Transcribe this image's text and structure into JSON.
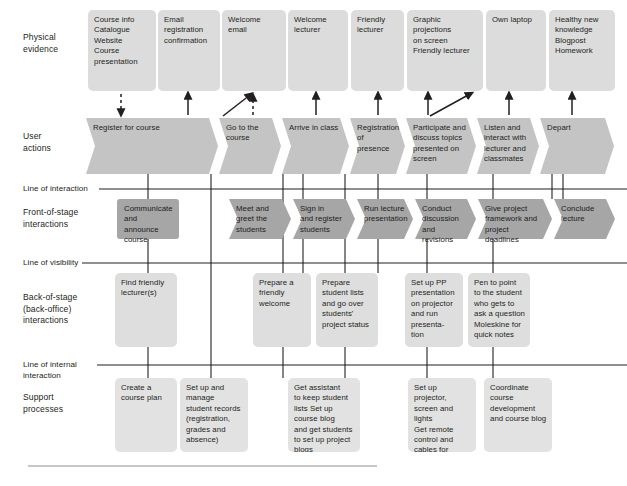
{
  "diagram": {
    "colors": {
      "evidence_fill": "#dcdcdc",
      "user_actions_fill": "#c4c4c4",
      "front_stage_fill": "#a6a6a6",
      "back_stage_fill": "#dedede",
      "support_fill": "#e2e2e2",
      "line_color": "#231f20",
      "text_color": "#231f20"
    }
  },
  "row_labels": {
    "physical_evidence": "Physical\nevidence",
    "user_actions": "User\nactions",
    "front_of_stage": "Front-of-stage\ninteractions",
    "back_of_stage": "Back-of-stage\n(back-office)\ninteractions",
    "support_processes": "Support\nprocesses"
  },
  "separator_lines": {
    "line_of_interaction": "Line of interaction",
    "line_of_visibility": "Line of visibility",
    "line_of_internal_interaction": "Line of internal\ninteraction"
  },
  "physical_evidence": [
    {
      "text": "Course info\nCatalogue\nWebsite\nCourse\npresentation",
      "x": 88,
      "y": 10,
      "w": 68,
      "h": 81
    },
    {
      "text": "Email\nregistration\nconfirmation",
      "x": 158,
      "y": 10,
      "w": 62,
      "h": 81
    },
    {
      "text": "Welcome\nemail",
      "x": 222,
      "y": 10,
      "w": 64,
      "h": 81
    },
    {
      "text": "Welcome\nlecturer",
      "x": 288,
      "y": 10,
      "w": 60,
      "h": 81
    },
    {
      "text": "Friendly\nlecturer",
      "x": 351,
      "y": 10,
      "w": 53,
      "h": 81
    },
    {
      "text": "Graphic\nprojections\non screen\nFriendly lecturer",
      "x": 407,
      "y": 10,
      "w": 76,
      "h": 81
    },
    {
      "text": "Own laptop",
      "x": 486,
      "y": 10,
      "w": 60,
      "h": 81
    },
    {
      "text": "Healthy new\nknowledge\nBlogpost\nHomework",
      "x": 549,
      "y": 10,
      "w": 66,
      "h": 81
    }
  ],
  "user_actions": [
    {
      "text": "Register for course",
      "x": 86,
      "y": 118,
      "w": 132,
      "h": 56
    },
    {
      "text": "Go to the\ncourse",
      "x": 219,
      "y": 118,
      "w": 62,
      "h": 56
    },
    {
      "text": "Arrive in class",
      "x": 282,
      "y": 118,
      "w": 67,
      "h": 56
    },
    {
      "text": "Registration\nof presence",
      "x": 350,
      "y": 118,
      "w": 55,
      "h": 56
    },
    {
      "text": "Participate and\ndiscuss topics\npresented on\nscreen",
      "x": 406,
      "y": 118,
      "w": 70,
      "h": 56
    },
    {
      "text": "Listen and\ninteract with\nlecturer and\nclassmates",
      "x": 477,
      "y": 118,
      "w": 62,
      "h": 56
    },
    {
      "text": "Depart",
      "x": 540,
      "y": 118,
      "w": 74,
      "h": 56
    }
  ],
  "front_of_stage": [
    {
      "text": "Communicate\nand announce\ncourse",
      "x": 117,
      "y": 199,
      "w": 62,
      "h": 40,
      "shape": "rounded"
    },
    {
      "text": "Meet and\ngreet the\nstudents",
      "x": 229,
      "y": 199,
      "w": 62,
      "h": 40,
      "shape": "chevron"
    },
    {
      "text": "Sign in\nand register\nstudents",
      "x": 293,
      "y": 199,
      "w": 62,
      "h": 40,
      "shape": "chevron"
    },
    {
      "text": "Run lecture\npresentation",
      "x": 357,
      "y": 199,
      "w": 56,
      "h": 40,
      "shape": "chevron"
    },
    {
      "text": "Conduct\ndiscussion\nand revisions",
      "x": 415,
      "y": 199,
      "w": 61,
      "h": 40,
      "shape": "chevron"
    },
    {
      "text": "Give project\nframework and\nproject deadlines",
      "x": 478,
      "y": 199,
      "w": 74,
      "h": 40,
      "shape": "chevron"
    },
    {
      "text": "Conclude\nlecture",
      "x": 554,
      "y": 199,
      "w": 61,
      "h": 40,
      "shape": "chevron"
    }
  ],
  "back_of_stage": [
    {
      "text": "Find friendly\nlecturer(s)",
      "x": 115,
      "y": 273,
      "w": 62,
      "h": 74
    },
    {
      "text": "Prepare a\nfriendly\nwelcome",
      "x": 253,
      "y": 273,
      "w": 58,
      "h": 74
    },
    {
      "text": "Prepare\nstudent lists\nand go over\nstudents'\nproject status",
      "x": 316,
      "y": 273,
      "w": 62,
      "h": 74
    },
    {
      "text": "Set up PP\npresentation\non projector\nand run\npresenta- tion",
      "x": 405,
      "y": 273,
      "w": 58,
      "h": 74
    },
    {
      "text": "Pen to point\nto the student\nwho gets to\nask a question\nMoleskine for\nquick notes",
      "x": 468,
      "y": 273,
      "w": 62,
      "h": 74
    }
  ],
  "support_processes": [
    {
      "text": "Create a\ncourse plan",
      "x": 115,
      "y": 378,
      "w": 62,
      "h": 74
    },
    {
      "text": "Set up and\nmanage\nstudent records\n(registration,\ngrades and\nabsence)",
      "x": 180,
      "y": 378,
      "w": 68,
      "h": 74
    },
    {
      "text": "Get assistant\nto keep student\nlists Set up\ncourse blog\nand get students\nto set up project\nblogs",
      "x": 288,
      "y": 378,
      "w": 72,
      "h": 74
    },
    {
      "text": "Set up projector,\nscreen and lights\nGet remote\ncontrol and\ncables for\nprojector",
      "x": 408,
      "y": 378,
      "w": 68,
      "h": 74
    },
    {
      "text": "Coordinate\ncourse\ndevelopment\nand course blog",
      "x": 484,
      "y": 378,
      "w": 68,
      "h": 74
    }
  ]
}
